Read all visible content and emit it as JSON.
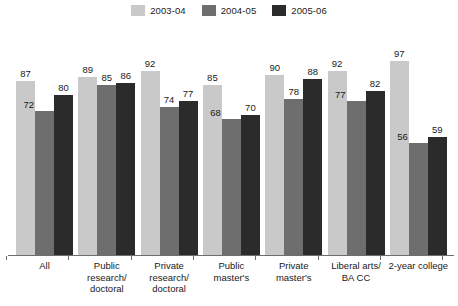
{
  "chart_data": {
    "type": "bar",
    "title": "",
    "subtitle": "",
    "xlabel": "",
    "ylabel": "",
    "ylim": [
      0,
      100
    ],
    "grid": false,
    "legend_position": "top-center",
    "categories": [
      "All",
      "Public research/ doctoral",
      "Private research/ doctoral",
      "Public master's",
      "Private master's",
      "Liberal arts/ BA CC",
      "2-year college"
    ],
    "series": [
      {
        "name": "2003-04",
        "color": "#c9c9c9",
        "values": [
          87,
          89,
          92,
          85,
          90,
          92,
          97
        ]
      },
      {
        "name": "2004-05",
        "color": "#6e6e6e",
        "values": [
          72,
          85,
          74,
          68,
          78,
          77,
          56
        ]
      },
      {
        "name": "2005-06",
        "color": "#2b2b2b",
        "values": [
          80,
          86,
          77,
          70,
          88,
          82,
          59
        ]
      }
    ]
  },
  "legend": {
    "items": [
      {
        "label": "2003-04",
        "color": "#c9c9c9",
        "swatch_name": "legend-swatch-2003-04"
      },
      {
        "label": "2004-05",
        "color": "#6e6e6e",
        "swatch_name": "legend-swatch-2004-05"
      },
      {
        "label": "2005-06",
        "color": "#2b2b2b",
        "swatch_name": "legend-swatch-2005-06"
      }
    ]
  },
  "axis": {
    "baseline_color": "#6d6d6d",
    "x_tick_labels": [
      {
        "lines": [
          "All"
        ]
      },
      {
        "lines": [
          "Public",
          "research/",
          "doctoral"
        ]
      },
      {
        "lines": [
          "Private",
          "research/",
          "doctoral"
        ]
      },
      {
        "lines": [
          "Public",
          "master's"
        ]
      },
      {
        "lines": [
          "Private",
          "master's"
        ]
      },
      {
        "lines": [
          "Liberal arts/",
          "BA CC"
        ]
      },
      {
        "lines": [
          "2-year college"
        ]
      }
    ]
  },
  "bar_labels": {
    "g0": {
      "s0": "87",
      "s1": "72",
      "s2": "80"
    },
    "g1": {
      "s0": "89",
      "s1": "85",
      "s2": "86"
    },
    "g2": {
      "s0": "92",
      "s1": "74",
      "s2": "77"
    },
    "g3": {
      "s0": "85",
      "s1": "68",
      "s2": "70"
    },
    "g4": {
      "s0": "90",
      "s1": "78",
      "s2": "88"
    },
    "g5": {
      "s0": "92",
      "s1": "77",
      "s2": "82"
    },
    "g6": {
      "s0": "97",
      "s1": "56",
      "s2": "59"
    }
  }
}
